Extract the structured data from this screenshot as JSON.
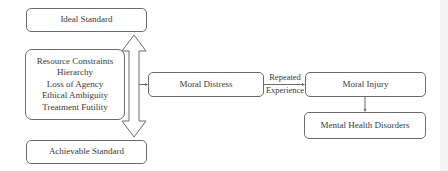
{
  "diagram": {
    "nodes": {
      "ideal_standard": "Ideal Standard",
      "factors": [
        "Resource Constraints",
        "Hierarchy",
        "Loss of Agency",
        "Ethical Ambiguity",
        "Treatment Futility"
      ],
      "achievable_standard": "Achievable Standard",
      "moral_distress": "Moral Distress",
      "moral_injury": "Moral Injury",
      "mental_health_disorders": "Mental Health Disorders"
    },
    "edges": [
      {
        "from": "factors",
        "to": "ideal_standard",
        "style": "hollow-double-arrow-up"
      },
      {
        "from": "factors",
        "to": "achievable_standard",
        "style": "hollow-double-arrow-down"
      },
      {
        "from": "gap",
        "to": "moral_distress",
        "style": "line-arrow"
      },
      {
        "from": "moral_distress",
        "to": "moral_injury",
        "style": "line-arrow",
        "label": [
          "Repeated",
          "Experience"
        ]
      },
      {
        "from": "moral_injury",
        "to": "mental_health_disorders",
        "style": "line-arrow"
      }
    ],
    "edge_labels": {
      "repeated_top": "Repeated",
      "repeated_bottom": "Experience"
    },
    "colors": {
      "stroke": "#6b6b6b",
      "text": "#3a3a3a",
      "background": "#ffffff"
    }
  }
}
